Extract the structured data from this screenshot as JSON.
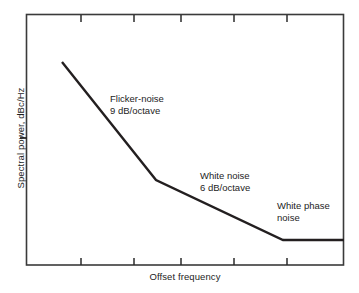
{
  "chart_data": {
    "type": "line",
    "title": "",
    "subtitle": "",
    "xlabel": "Offset frequency",
    "ylabel": "Spectral power, dBc/Hz",
    "xlim": [
      0,
      100
    ],
    "ylim": [
      0,
      100
    ],
    "grid": false,
    "legend": "none",
    "xticks": [
      17.3,
      34.0,
      48.7,
      65.4,
      82.1
    ],
    "xticklabels": [
      "",
      "",
      "",
      "",
      ""
    ],
    "yticks": [
      50.6
    ],
    "yticklabels": [
      ""
    ],
    "axis_style": "box-frame-with-inward-ticks",
    "series": [
      {
        "name": "Phase noise spectrum",
        "color": "#231f20",
        "linewidth": 2.2,
        "x": [
          11.3,
          40.9,
          80.8,
          100.0
        ],
        "y": [
          80.9,
          33.9,
          10.0,
          10.0
        ],
        "px_points": [
          [
            62,
            62
          ],
          [
            156,
            180
          ],
          [
            283,
            240
          ],
          [
            344,
            240
          ]
        ],
        "segments": [
          {
            "name": "Flicker-noise region",
            "slope_db_per_octave": 9
          },
          {
            "name": "White noise region",
            "slope_db_per_octave": 6
          },
          {
            "name": "White phase noise region",
            "slope_db_per_octave": 0
          }
        ]
      }
    ],
    "annotations": [
      {
        "id": "flicker",
        "line1": "Flicker-noise",
        "line2": "9 dB/octave"
      },
      {
        "id": "white",
        "line1": "White noise",
        "line2": "6 dB/octave"
      },
      {
        "id": "phase",
        "line1": "White phase",
        "line2": "noise"
      }
    ]
  }
}
